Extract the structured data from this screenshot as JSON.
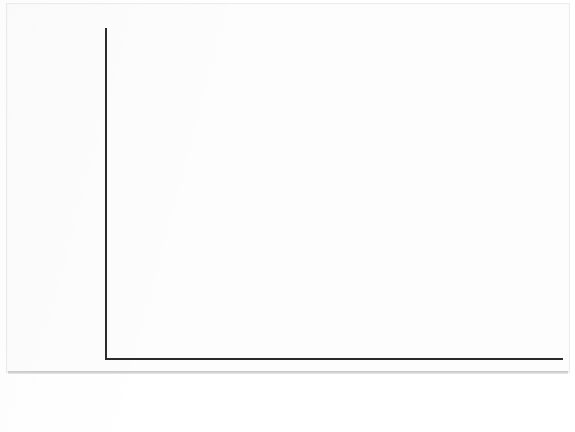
{
  "figure": {
    "caption": "A.",
    "panel_label": "A."
  },
  "chart_data": {
    "type": "line",
    "title": "",
    "xlabel": "",
    "ylabel": "Temperature difference (°C)\ncompared to 1951-80 mean",
    "ylabel_line1": "Temperature difference (°C)",
    "ylabel_line2": "compared to 1951-80 mean",
    "xlim": [
      1880,
      2010
    ],
    "ylim": [
      -0.4,
      0.62
    ],
    "grid": true,
    "legend": "none",
    "series_color": "#8a8a8a",
    "marker": "square",
    "xticks": [
      1880,
      1900,
      1920,
      1940,
      1960,
      1980,
      2000
    ],
    "xtick_labels": [
      "1880",
      "1900",
      "1920",
      "1940",
      "1960",
      "1980",
      "2000"
    ],
    "yticks": [
      -0.4,
      -0.2,
      0,
      0.2,
      0.4,
      0.6
    ],
    "ytick_labels": [
      "-.4",
      "-.2",
      "0",
      ".2",
      ".4",
      ".6"
    ],
    "x": [
      1880,
      1881,
      1882,
      1883,
      1884,
      1885,
      1886,
      1887,
      1888,
      1889,
      1890,
      1891,
      1892,
      1893,
      1894,
      1895,
      1896,
      1897,
      1898,
      1899,
      1900,
      1901,
      1902,
      1903,
      1904,
      1905,
      1906,
      1907,
      1908,
      1909,
      1910,
      1911,
      1912,
      1913,
      1914,
      1915,
      1916,
      1917,
      1918,
      1919,
      1920,
      1921,
      1922,
      1923,
      1924,
      1925,
      1926,
      1927,
      1928,
      1929,
      1930,
      1931,
      1932,
      1933,
      1934,
      1935,
      1936,
      1937,
      1938,
      1939,
      1940,
      1941,
      1942,
      1943,
      1944,
      1945,
      1946,
      1947,
      1948,
      1949,
      1950,
      1951,
      1952,
      1953,
      1954,
      1955,
      1956,
      1957,
      1958,
      1959,
      1960,
      1961,
      1962,
      1963,
      1964,
      1965,
      1966,
      1967,
      1968,
      1969,
      1970,
      1971,
      1972,
      1973,
      1974,
      1975,
      1976,
      1977,
      1978,
      1979,
      1980,
      1981,
      1982,
      1983,
      1984,
      1985,
      1986,
      1987,
      1988,
      1989,
      1990,
      1991,
      1992,
      1993,
      1994,
      1995,
      1996,
      1997,
      1998,
      1999,
      2000,
      2001,
      2002,
      2003,
      2004,
      2005,
      2006,
      2007,
      2008,
      2009,
      2010
    ],
    "values": [
      -0.22,
      -0.2,
      -0.23,
      -0.25,
      -0.29,
      -0.29,
      -0.29,
      -0.33,
      -0.28,
      -0.17,
      -0.31,
      -0.29,
      -0.33,
      -0.34,
      -0.3,
      -0.29,
      -0.17,
      -0.16,
      -0.28,
      -0.21,
      -0.14,
      -0.18,
      -0.26,
      -0.33,
      -0.34,
      -0.26,
      -0.23,
      -0.34,
      -0.32,
      -0.33,
      -0.33,
      -0.36,
      -0.31,
      -0.3,
      -0.2,
      -0.14,
      -0.29,
      -0.4,
      -0.31,
      -0.24,
      -0.21,
      -0.19,
      -0.23,
      -0.22,
      -0.23,
      -0.18,
      -0.07,
      -0.14,
      -0.11,
      -0.25,
      -0.06,
      -0.04,
      -0.11,
      -0.16,
      -0.12,
      -0.14,
      -0.11,
      0.0,
      0.03,
      0.0,
      0.1,
      0.14,
      0.05,
      0.09,
      0.2,
      0.09,
      -0.05,
      0.0,
      -0.05,
      -0.08,
      -0.16,
      -0.05,
      0.02,
      0.09,
      -0.12,
      -0.13,
      -0.18,
      0.04,
      0.07,
      0.05,
      0.03,
      0.07,
      0.05,
      0.07,
      -0.2,
      -0.1,
      -0.03,
      -0.02,
      -0.07,
      0.06,
      0.04,
      -0.09,
      0.03,
      0.14,
      -0.06,
      -0.03,
      -0.15,
      0.12,
      0.02,
      0.1,
      0.2,
      0.26,
      0.06,
      0.26,
      0.1,
      0.06,
      0.12,
      0.25,
      0.32,
      0.27,
      0.38,
      0.35,
      0.2,
      0.22,
      0.29,
      0.38,
      0.3,
      0.42,
      0.56,
      0.32,
      0.33,
      0.47,
      0.56,
      0.55,
      0.48,
      0.62,
      0.54,
      0.57,
      0.44,
      0.56,
      0.55
    ]
  },
  "axes": {
    "y_axis_name": "temperature-anomaly-axis",
    "x_axis_name": "year-axis"
  }
}
